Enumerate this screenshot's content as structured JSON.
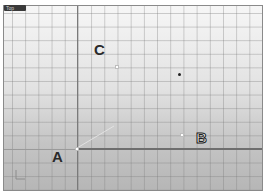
{
  "viewport": {
    "title": "Top",
    "colors": {
      "background_top": "#f6f6f6",
      "background_bottom": "#b6b6b6",
      "grid": "#8a8a8a",
      "axis": "#6e6e6e"
    }
  },
  "points": [
    {
      "label": "A",
      "x": 76,
      "y": 148
    },
    {
      "label": "B",
      "x": 181,
      "y": 134
    },
    {
      "label": "C",
      "x": 116,
      "y": 66
    }
  ],
  "labels": {
    "a": "A",
    "b": "B",
    "c": "C"
  },
  "marker": {
    "x": 178,
    "y": 73
  },
  "axis_icon": "xy-axis-triad-icon"
}
